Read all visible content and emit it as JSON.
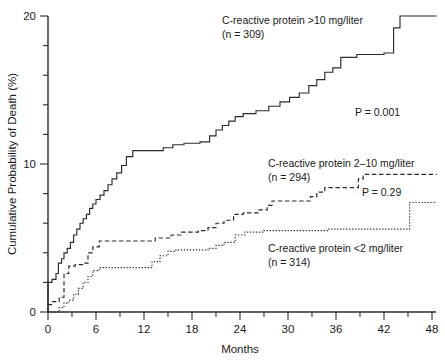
{
  "chart_data": {
    "type": "line",
    "title": "",
    "subtitle": "",
    "xlabel": "Months",
    "ylabel": "Cumulative Probability of Death (%)",
    "xlim": [
      0,
      48
    ],
    "ylim": [
      0,
      20
    ],
    "xticks": [
      0,
      6,
      12,
      18,
      24,
      30,
      36,
      42,
      48
    ],
    "xtick_labels": [
      "0",
      "6",
      "12",
      "18",
      "24",
      "30",
      "36",
      "42",
      "48"
    ],
    "xminor_tick_interval": 3,
    "yticks": [
      0,
      10,
      20
    ],
    "ytick_labels": [
      "0",
      "10",
      "20"
    ],
    "yminor_tick_interval": 2,
    "grid": false,
    "legend_position": "inline-annotations",
    "step_style": "post",
    "series": [
      {
        "name": "C-reactive protein >10 mg/liter",
        "label_line1": "C-reactive protein >10 mg/liter",
        "label_line2": "(n = 309)",
        "n": 309,
        "linestyle": "solid",
        "color": "#2b2b2b",
        "points": [
          [
            0,
            0
          ],
          [
            0,
            2.0
          ],
          [
            0.5,
            2.2
          ],
          [
            1.0,
            2.6
          ],
          [
            1.3,
            3.3
          ],
          [
            1.7,
            3.6
          ],
          [
            2.0,
            4.0
          ],
          [
            2.4,
            4.3
          ],
          [
            2.8,
            4.7
          ],
          [
            3.2,
            5.2
          ],
          [
            3.6,
            5.6
          ],
          [
            4.0,
            6.0
          ],
          [
            4.4,
            6.3
          ],
          [
            4.8,
            6.6
          ],
          [
            5.2,
            7.0
          ],
          [
            5.6,
            7.3
          ],
          [
            6.0,
            7.6
          ],
          [
            6.5,
            7.9
          ],
          [
            7.0,
            8.2
          ],
          [
            7.5,
            8.6
          ],
          [
            8.0,
            9.0
          ],
          [
            8.6,
            9.4
          ],
          [
            9.2,
            9.9
          ],
          [
            9.8,
            10.5
          ],
          [
            10.6,
            10.9
          ],
          [
            13.0,
            10.9
          ],
          [
            14.4,
            11.1
          ],
          [
            15.6,
            11.3
          ],
          [
            17.0,
            11.4
          ],
          [
            19.0,
            11.5
          ],
          [
            20.2,
            11.9
          ],
          [
            21.0,
            12.3
          ],
          [
            21.8,
            12.6
          ],
          [
            22.6,
            12.9
          ],
          [
            23.4,
            13.2
          ],
          [
            24.4,
            13.4
          ],
          [
            26.0,
            13.6
          ],
          [
            27.6,
            13.9
          ],
          [
            29.0,
            14.2
          ],
          [
            30.2,
            14.5
          ],
          [
            31.4,
            14.8
          ],
          [
            32.6,
            15.3
          ],
          [
            33.6,
            15.7
          ],
          [
            34.6,
            16.2
          ],
          [
            35.6,
            16.5
          ],
          [
            36.6,
            17.2
          ],
          [
            38.6,
            17.4
          ],
          [
            42.0,
            17.5
          ],
          [
            43.2,
            19.2
          ],
          [
            44.0,
            20.0
          ],
          [
            48.6,
            20.0
          ]
        ]
      },
      {
        "name": "C-reactive protein 2-10 mg/liter",
        "label_line1": "C-reactive protein 2–10 mg/liter",
        "label_line2": "(n = 294)",
        "n": 294,
        "linestyle": "dashed",
        "color": "#2b2b2b",
        "points": [
          [
            0,
            0
          ],
          [
            0,
            0.5
          ],
          [
            0.6,
            0.7
          ],
          [
            1.4,
            1.0
          ],
          [
            2.0,
            2.6
          ],
          [
            2.6,
            3.1
          ],
          [
            3.4,
            3.2
          ],
          [
            4.6,
            3.3
          ],
          [
            5.0,
            4.0
          ],
          [
            5.6,
            4.4
          ],
          [
            6.4,
            4.8
          ],
          [
            12.0,
            4.8
          ],
          [
            13.4,
            5.0
          ],
          [
            15.4,
            5.2
          ],
          [
            16.6,
            5.4
          ],
          [
            18.8,
            5.5
          ],
          [
            20.0,
            5.7
          ],
          [
            21.0,
            6.0
          ],
          [
            22.0,
            6.2
          ],
          [
            23.2,
            6.6
          ],
          [
            24.4,
            6.7
          ],
          [
            26.4,
            6.9
          ],
          [
            27.4,
            7.2
          ],
          [
            28.0,
            7.5
          ],
          [
            32.0,
            7.5
          ],
          [
            32.8,
            7.8
          ],
          [
            33.6,
            8.1
          ],
          [
            34.6,
            8.4
          ],
          [
            38.0,
            8.4
          ],
          [
            38.8,
            9.0
          ],
          [
            39.4,
            9.3
          ],
          [
            48.6,
            9.3
          ]
        ]
      },
      {
        "name": "C-reactive protein <2 mg/liter",
        "label_line1": "C-reactive protein <2 mg/liter",
        "label_line2": "(n = 314)",
        "n": 314,
        "linestyle": "dotted",
        "color": "#2b2b2b",
        "points": [
          [
            0,
            0
          ],
          [
            0.8,
            0.0
          ],
          [
            1.4,
            0.3
          ],
          [
            2.0,
            0.6
          ],
          [
            2.6,
            0.8
          ],
          [
            3.2,
            1.2
          ],
          [
            3.8,
            1.6
          ],
          [
            4.4,
            2.0
          ],
          [
            5.0,
            2.4
          ],
          [
            5.6,
            2.8
          ],
          [
            6.4,
            3.0
          ],
          [
            12.0,
            3.0
          ],
          [
            13.0,
            3.4
          ],
          [
            14.0,
            3.8
          ],
          [
            15.0,
            4.1
          ],
          [
            16.0,
            4.2
          ],
          [
            20.0,
            4.3
          ],
          [
            21.0,
            4.5
          ],
          [
            22.0,
            4.7
          ],
          [
            23.4,
            5.2
          ],
          [
            24.6,
            5.4
          ],
          [
            27.0,
            5.5
          ],
          [
            34.0,
            5.5
          ],
          [
            35.0,
            5.6
          ],
          [
            44.6,
            5.6
          ],
          [
            45.2,
            7.4
          ],
          [
            48.6,
            7.4
          ]
        ]
      }
    ],
    "annotations": [
      {
        "id": "p-value-main",
        "text": "P = 0.001",
        "x": 38.5,
        "y": 14.6
      },
      {
        "id": "p-value-secondary",
        "text": "P = 0.29",
        "x": 39.5,
        "y": 8.2
      }
    ]
  }
}
